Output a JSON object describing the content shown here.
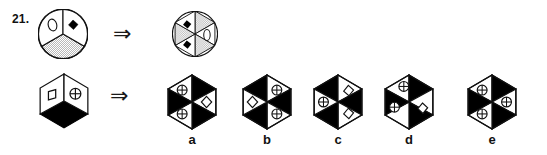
{
  "question": {
    "number_label": "21.",
    "type": "visual-analogy-multiple-choice"
  },
  "colors": {
    "ink": "#111111",
    "fill_black": "#000000",
    "fill_white": "#ffffff",
    "stipple": "#9a9a9a",
    "background": "#ffffff"
  },
  "arrows": {
    "glyph": "⇒",
    "name": "implies-arrow",
    "count": 2
  },
  "rows": [
    {
      "id": "row-1",
      "prompt": {
        "shape": "circle",
        "name": "prompt-circle-3-sector",
        "sectors": 3,
        "contents": [
          "ellipse-outline",
          "black-diamond",
          "stippled"
        ]
      },
      "result": {
        "shape": "circle",
        "name": "result-circle-6-sector",
        "sectors": 6,
        "contents": [
          "black-diamond",
          "stippled",
          "stippled",
          "black-diamond",
          "stippled",
          "ellipse-outline"
        ]
      }
    },
    {
      "id": "row-2",
      "prompt": {
        "shape": "hexagon-cube",
        "name": "prompt-hexagon-3-face",
        "faces": 3,
        "contents": [
          "white-square-outline",
          "circle-cross",
          "black-fill"
        ]
      },
      "result": "multiple-choice"
    }
  ],
  "options": [
    {
      "label": "a",
      "name": "option-a",
      "shape": "hexagon-6-sector",
      "sector_fill": [
        "white",
        "black",
        "white",
        "black",
        "white",
        "black"
      ],
      "sector_symbols": [
        "circle-cross",
        "none",
        "diamond-outline",
        "none",
        "circle-cross",
        "none"
      ]
    },
    {
      "label": "b",
      "name": "option-b",
      "shape": "hexagon-6-sector",
      "sector_fill": [
        "black",
        "white",
        "black",
        "white",
        "black",
        "white"
      ],
      "sector_symbols": [
        "none",
        "circle-cross",
        "none",
        "circle-cross",
        "none",
        "diamond-outline"
      ]
    },
    {
      "label": "c",
      "name": "option-c",
      "shape": "hexagon-6-sector",
      "sector_fill": [
        "black",
        "white",
        "black",
        "white",
        "black",
        "white"
      ],
      "sector_symbols": [
        "none",
        "diamond-outline",
        "none",
        "diamond-outline",
        "none",
        "circle-cross"
      ]
    },
    {
      "label": "d",
      "name": "option-d",
      "shape": "hexagon-6-sector",
      "sector_fill": [
        "white",
        "black",
        "white",
        "black",
        "white",
        "black"
      ],
      "sector_symbols": [
        "circle-cross",
        "none",
        "diamond-outline",
        "none",
        "circle-cross",
        "none"
      ]
    },
    {
      "label": "e",
      "name": "option-e",
      "shape": "hexagon-6-sector",
      "sector_fill": [
        "white",
        "black",
        "white",
        "black",
        "white",
        "black"
      ],
      "sector_symbols": [
        "circle-cross",
        "none",
        "circle-cross",
        "none",
        "circle-cross",
        "none"
      ]
    }
  ]
}
